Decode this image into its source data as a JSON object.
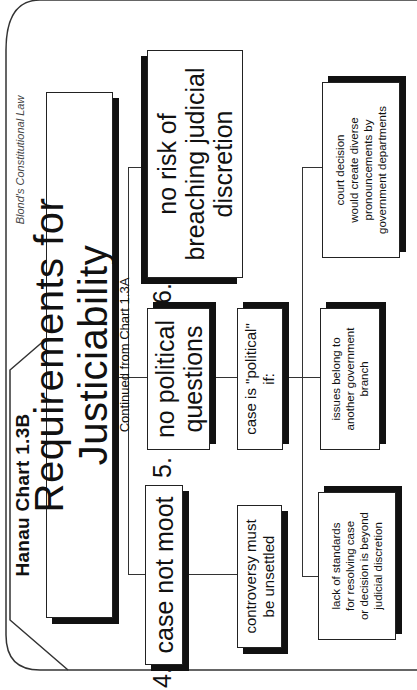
{
  "header": {
    "chart_tab": "Hanau Chart 1.3B",
    "publisher": "Blond's Constitutional Law"
  },
  "title": {
    "main": "Requirements for Justiciability",
    "subtitle": "Continued from Chart 1.3A"
  },
  "requirements": [
    {
      "number": "4.",
      "label": "case not moot"
    },
    {
      "number": "5.",
      "label_line1": "no political",
      "label_line2": "questions"
    },
    {
      "number": "6.",
      "label_line1": "no risk of",
      "label_line2": "breaching judicial",
      "label_line3": "discretion"
    }
  ],
  "sub_nodes": {
    "moot_condition": {
      "line1": "controversy must",
      "line2": "be unsettled"
    },
    "political_if": {
      "line1": "case is \"political\"",
      "line2": "if:"
    },
    "political_conditions": [
      {
        "line1": "lack of standards",
        "line2": "for resolving case",
        "line3": "or decision is beyond",
        "line4": "judicial discretion"
      },
      {
        "line1": "issues belong to",
        "line2": "another government",
        "line3": "branch"
      },
      {
        "line1": "court decision",
        "line2": "would create diverse",
        "line3": "pronouncements by",
        "line4": "government departments"
      }
    ]
  }
}
